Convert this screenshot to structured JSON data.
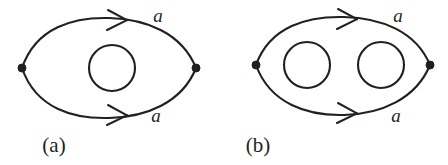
{
  "figure": {
    "background_color": "#ffffff",
    "ink_color": "#231f20",
    "width": 448,
    "height": 165,
    "panels": [
      {
        "id": "panel-a",
        "caption": "(a)",
        "caption_x": 54,
        "caption_y": 152,
        "vertex_left": {
          "x": 22,
          "y": 68
        },
        "vertex_right": {
          "x": 196,
          "y": 68
        },
        "top_edge": {
          "label": "a",
          "label_x": 158,
          "label_y": 22,
          "direction": "right",
          "arrow_x": 118,
          "arrow_y": 20,
          "path": "M 22,68 C 36,27 74,17 109,18 C 146,19 182,33 196,68"
        },
        "bottom_edge": {
          "label": "a",
          "label_x": 156,
          "label_y": 122,
          "direction": "right",
          "arrow_x": 118,
          "arrow_y": 115,
          "path": "M 22,68 C 36,109 74,119 109,118 C 146,117 182,103 196,68"
        },
        "inner_loops": [
          {
            "cx": 112,
            "cy": 68,
            "r": 23
          }
        ]
      },
      {
        "id": "panel-b",
        "caption": "(b)",
        "caption_x": 258,
        "caption_y": 152,
        "vertex_left": {
          "x": 256,
          "y": 65
        },
        "vertex_right": {
          "x": 430,
          "y": 65
        },
        "top_edge": {
          "label": "a",
          "label_x": 398,
          "label_y": 22,
          "direction": "right",
          "arrow_x": 348,
          "arrow_y": 19,
          "path": "M 256,65 C 270,26 308,16 344,17 C 381,18 416,31 430,65"
        },
        "bottom_edge": {
          "label": "a",
          "label_x": 396,
          "label_y": 122,
          "direction": "right",
          "arrow_x": 348,
          "arrow_y": 113,
          "path": "M 256,65 C 270,104 308,116 344,115 C 381,114 416,99 430,65"
        },
        "inner_loops": [
          {
            "cx": 307,
            "cy": 65,
            "r": 23
          },
          {
            "cx": 381,
            "cy": 65,
            "r": 23
          }
        ]
      }
    ]
  }
}
